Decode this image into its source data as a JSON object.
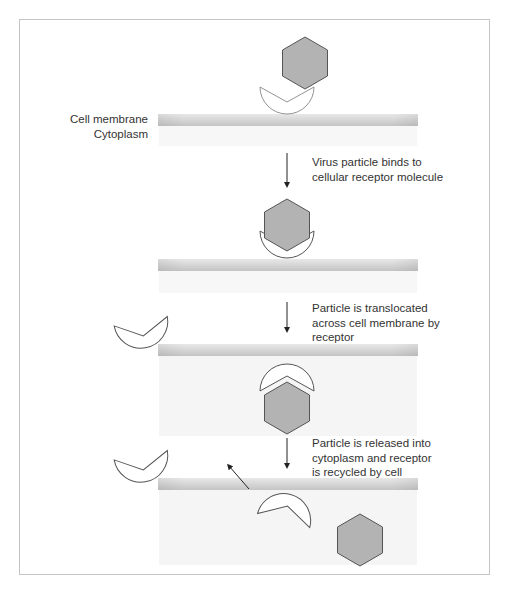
{
  "labels": {
    "cell_membrane": "Cell membrane",
    "cytoplasm": "Cytoplasm"
  },
  "steps": [
    {
      "text_line1": "Virus particle binds to",
      "text_line2": "cellular receptor molecule",
      "text_line3": ""
    },
    {
      "text_line1": "Particle is translocated",
      "text_line2": "across cell membrane by",
      "text_line3": "receptor"
    },
    {
      "text_line1": "Particle is released into",
      "text_line2": "cytoplasm and receptor",
      "text_line3": "is recycled by cell"
    }
  ],
  "colors": {
    "frame": "#c4c4c4",
    "membrane_top": "#e6e6e6",
    "membrane_bottom": "#c8c8c8",
    "cytoplasm": "#f6f6f6",
    "virus_fill": "#b3b3b3",
    "virus_stroke": "#555555",
    "receptor_fill": "#ffffff",
    "receptor_stroke": "#555555"
  }
}
